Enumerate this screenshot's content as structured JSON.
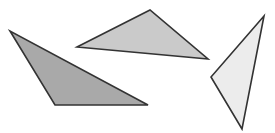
{
  "canvas": {
    "width": 275,
    "height": 133,
    "background": "#ffffff"
  },
  "stroke": {
    "color": "#333333",
    "width": 1.6
  },
  "triangles": [
    {
      "name": "dark-gray-triangle",
      "fill": "#a9a9a9",
      "points": "10,31 55,105 148,105"
    },
    {
      "name": "medium-gray-triangle",
      "fill": "#cacaca",
      "points": "77,47 150,10 208,59"
    },
    {
      "name": "light-gray-triangle",
      "fill": "#ececec",
      "points": "264,16 211,77 242,129"
    }
  ]
}
